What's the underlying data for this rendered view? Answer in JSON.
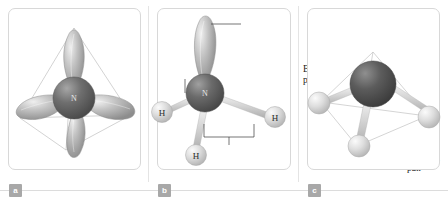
{
  "figure": {
    "panels": [
      {
        "id": "a",
        "badge": "a",
        "description": "sp3 hybrid orbitals of nitrogen in tetrahedral arrangement",
        "center_atom": "N",
        "lobe_count": 4
      },
      {
        "id": "b",
        "badge": "b",
        "description": "Ammonia molecule with one lone pair orbital and three bonding pairs to hydrogen",
        "center_atom": "N",
        "hydrogens": [
          "H",
          "H",
          "H"
        ]
      },
      {
        "id": "c",
        "badge": "c",
        "description": "Ball and stick model of ammonia within tetrahedral outline",
        "center_atom": "N",
        "hydrogens": [
          "H",
          "H",
          "H"
        ]
      }
    ]
  },
  "labels": {
    "lone_pair": "Lone\npair",
    "bonding_pair_left": "Bonding\npair",
    "bonding_pair_right": "Bonding\npair"
  },
  "atoms": {
    "nitrogen_symbol": "N",
    "hydrogen_symbol": "H"
  },
  "colors": {
    "background": "#ffffff",
    "panel_border": "#d8d8d8",
    "rule": "#dcdcdc",
    "badge_background": "#a8a8a8",
    "badge_text": "#ffffff",
    "nitrogen_sphere": "#5a5a5a",
    "hydrogen_sphere": "#cfcfcf",
    "orbital_lobe": "#9a9a9a",
    "wireframe": "#b8b8b8",
    "label_text": "#1a1a1a"
  }
}
